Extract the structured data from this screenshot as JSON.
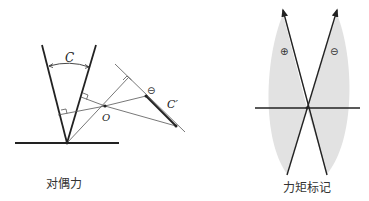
{
  "figures": [
    {
      "id": "couple",
      "caption": "对偶力",
      "labels": {
        "angle": "C",
        "point": "O",
        "couple_result": "C′",
        "sign": "⊖"
      }
    },
    {
      "id": "moment-sign",
      "caption": "力矩标记",
      "labels": {
        "left_sign": "⊕",
        "right_sign": "⊖"
      }
    }
  ],
  "colors": {
    "line": "#222222",
    "thin_line": "#555555",
    "shade": "#e2e2e2",
    "background": "#ffffff"
  }
}
